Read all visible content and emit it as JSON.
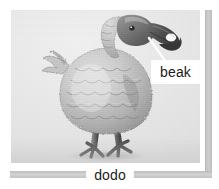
{
  "figure": {
    "kind": "labeled-illustration",
    "subject_caption": "dodo",
    "callouts": [
      {
        "id": "beak",
        "label": "beak",
        "points_to": "upper beak tip of the dodo"
      }
    ],
    "palette": {
      "plate_background": "#e8e8e8",
      "rule_gray": "#c6c6c6",
      "label_background": "#ffffff",
      "label_text": "#1b1b1b",
      "bird_light": "#d8d8d8",
      "bird_mid": "#a9a9a9",
      "bird_dark": "#5a5a5a",
      "beak_dark": "#4a4a4a",
      "leader_line": "#ffffff"
    },
    "icons": {
      "bird": "dodo-bird-illustration",
      "leader": "callout-leader-line"
    }
  }
}
